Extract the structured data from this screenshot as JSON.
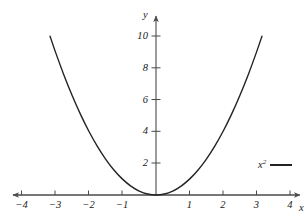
{
  "figure": {
    "background_color": "#ffffff",
    "axis_color": "#4a4a4a",
    "curve_color": "#232323",
    "text_color": "#1a1a1a"
  },
  "axes": {
    "x_name": "x",
    "y_name": "y"
  },
  "legend": {
    "label_base": "x",
    "label_exponent": "2",
    "swatch_color": "#232323"
  },
  "chart_data": {
    "type": "line",
    "title": "",
    "xlabel": "x",
    "ylabel": "y",
    "grid": false,
    "legend_position": "right",
    "xlim": [
      -4.4,
      4.4
    ],
    "ylim": [
      -0.6,
      10.8
    ],
    "xticks": [
      -4,
      -3,
      -2,
      -1,
      1,
      2,
      3,
      4
    ],
    "xticklabels": [
      "−4",
      "−3",
      "−2",
      "−1",
      "1",
      "2",
      "3",
      "4"
    ],
    "yticks": [
      2,
      4,
      6,
      8,
      10
    ],
    "yticklabels": [
      "2",
      "4",
      "6",
      "8",
      "10"
    ],
    "series": [
      {
        "name": "x²",
        "expression": "y = x^2",
        "color": "#232323",
        "x": [
          -3.162,
          -3.0,
          -2.75,
          -2.5,
          -2.25,
          -2.0,
          -1.75,
          -1.5,
          -1.25,
          -1.0,
          -0.75,
          -0.5,
          -0.25,
          0.0,
          0.25,
          0.5,
          0.75,
          1.0,
          1.25,
          1.5,
          1.75,
          2.0,
          2.25,
          2.5,
          2.75,
          3.0,
          3.162
        ],
        "y": [
          10.0,
          9.0,
          7.5625,
          6.25,
          5.0625,
          4.0,
          3.0625,
          2.25,
          1.5625,
          1.0,
          0.5625,
          0.25,
          0.0625,
          0.0,
          0.0625,
          0.25,
          0.5625,
          1.0,
          1.5625,
          2.25,
          3.0625,
          4.0,
          5.0625,
          6.25,
          7.5625,
          9.0,
          10.0
        ]
      }
    ]
  }
}
